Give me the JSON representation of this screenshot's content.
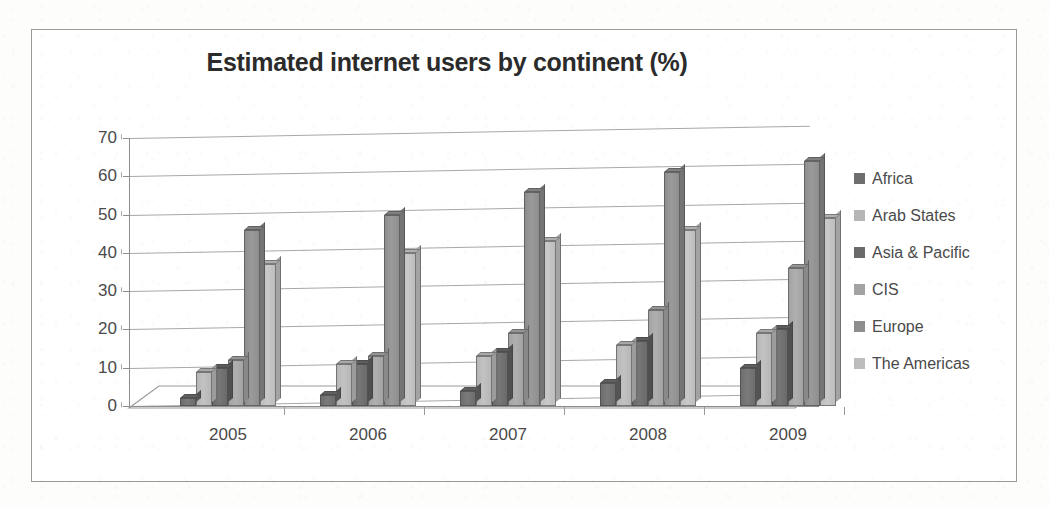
{
  "chart_data": {
    "type": "bar",
    "title": "Estimated internet users by continent (%)",
    "xlabel": "",
    "ylabel": "",
    "categories": [
      "2005",
      "2006",
      "2007",
      "2008",
      "2009"
    ],
    "series": [
      {
        "name": "Africa",
        "values": [
          2,
          3,
          4,
          6,
          10
        ],
        "color": "#6e6e6e"
      },
      {
        "name": "Arab States",
        "values": [
          9,
          11,
          13,
          16,
          19
        ],
        "color": "#b6b6b6"
      },
      {
        "name": "Asia & Pacific",
        "values": [
          10,
          11,
          14,
          17,
          20
        ],
        "color": "#6a6a6a"
      },
      {
        "name": "CIS",
        "values": [
          12,
          13,
          19,
          25,
          36
        ],
        "color": "#a3a3a3"
      },
      {
        "name": "Europe",
        "values": [
          46,
          50,
          56,
          61,
          64
        ],
        "color": "#8e8e8e"
      },
      {
        "name": "The Americas",
        "values": [
          37,
          40,
          43,
          46,
          49
        ],
        "color": "#bdbdbd"
      }
    ],
    "ylim": [
      0,
      70
    ],
    "yticks": [
      0,
      10,
      20,
      30,
      40,
      50,
      60,
      70
    ],
    "ytick_labels": [
      "0",
      "10",
      "20",
      "30",
      "40",
      "50",
      "60",
      "70"
    ],
    "grid": true,
    "legend_position": "right",
    "style_3d": true
  },
  "frame": {
    "border_color": "#9a9a9a",
    "background": "#ffffff"
  }
}
